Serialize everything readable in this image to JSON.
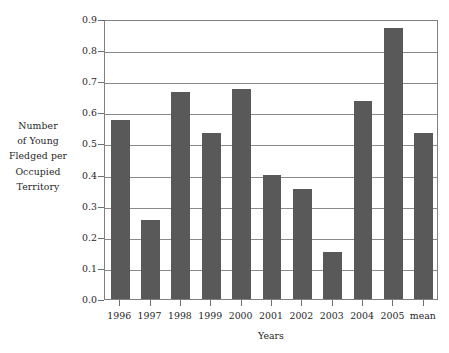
{
  "chart_data": {
    "type": "bar",
    "title": "",
    "subtitle": "",
    "xlabel": "Years",
    "ylabel": "Number of Young Fledged per Occupied Territory",
    "ylabel_lines": [
      "Number",
      "of Young",
      "Fledged per",
      "Occupied",
      "Territory"
    ],
    "categories": [
      "1996",
      "1997",
      "1998",
      "1999",
      "2000",
      "2001",
      "2002",
      "2003",
      "2004",
      "2005",
      "mean"
    ],
    "values": [
      0.575,
      0.255,
      0.665,
      0.535,
      0.675,
      0.4,
      0.355,
      0.15,
      0.635,
      0.87,
      0.535
    ],
    "ylim": [
      0.0,
      0.9
    ],
    "ytick_labels": [
      "0.0",
      "0.1",
      "0.2",
      "0.3",
      "0.4",
      "0.5",
      "0.6",
      "0.7",
      "0.8",
      "0.9"
    ],
    "ytick_values": [
      0.0,
      0.1,
      0.2,
      0.3,
      0.4,
      0.5,
      0.6,
      0.7,
      0.8,
      0.9
    ],
    "grid": true,
    "grid_axis": "y",
    "legend": false,
    "legend_position": "none",
    "bar_color": "#595959",
    "grid_color": "#8a8a8a",
    "axis_color": "#808080",
    "background_color": "#ffffff"
  }
}
